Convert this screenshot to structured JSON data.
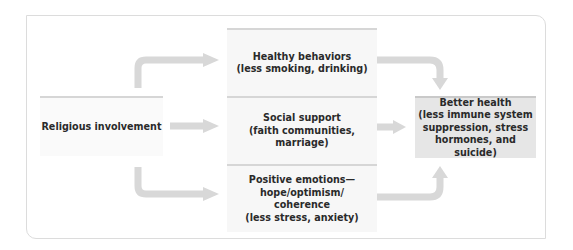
{
  "diagram": {
    "type": "flow",
    "colors": {
      "frame_border": "#dcdcdc",
      "box_fill": "#f7f7f7",
      "target_fill": "#e6e6e6",
      "arrow": "#d8d8d8",
      "text": "#2a2a2a"
    },
    "source": {
      "label": "Religious involvement"
    },
    "mediators": [
      {
        "line1": "Healthy behaviors",
        "line2": "(less smoking, drinking)"
      },
      {
        "line1": "Social support",
        "line2": "(faith communities,",
        "line3": "marriage)"
      },
      {
        "line1": "Positive emotions—",
        "line2": "hope/optimism/",
        "line3": "coherence",
        "line4": "(less stress, anxiety)"
      }
    ],
    "outcome": {
      "line1": "Better health",
      "line2": "(less immune system",
      "line3": "suppression, stress",
      "line4": "hormones, and suicide)"
    },
    "edges": [
      {
        "from": "Religious involvement",
        "to": "Healthy behaviors"
      },
      {
        "from": "Religious involvement",
        "to": "Social support"
      },
      {
        "from": "Religious involvement",
        "to": "Positive emotions"
      },
      {
        "from": "Healthy behaviors",
        "to": "Better health"
      },
      {
        "from": "Social support",
        "to": "Better health"
      },
      {
        "from": "Positive emotions",
        "to": "Better health"
      }
    ]
  }
}
